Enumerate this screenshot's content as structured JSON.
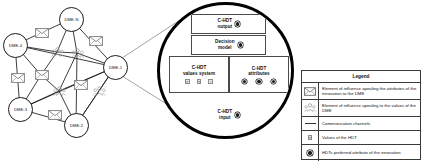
{
  "figure": {
    "network": {
      "nodes": [
        {
          "id": "dme-n",
          "label": "DME-N",
          "x": 59,
          "y": 7,
          "size": 25
        },
        {
          "id": "dme-4",
          "label": "DME-4",
          "x": 3,
          "y": 33,
          "size": 25
        },
        {
          "id": "dme-1",
          "label": "DME-1",
          "x": 103,
          "y": 55,
          "size": 25
        },
        {
          "id": "dme-3",
          "label": "DME-3",
          "x": 8,
          "y": 97,
          "size": 25
        },
        {
          "id": "dme-2",
          "label": "DME-2",
          "x": 64,
          "y": 113,
          "size": 25
        }
      ],
      "mail_icons": [
        {
          "id": "mail-1",
          "x": 35,
          "y": 28
        },
        {
          "id": "mail-2",
          "x": 89,
          "y": 36
        },
        {
          "id": "mail-3",
          "x": 11,
          "y": 73
        },
        {
          "id": "mail-4",
          "x": 35,
          "y": 70
        },
        {
          "id": "mail-5",
          "x": 74,
          "y": 80
        },
        {
          "id": "mail-6",
          "x": 48,
          "y": 110
        }
      ],
      "people_icons": [
        {
          "id": "people-1",
          "x": 51,
          "y": 47
        },
        {
          "id": "people-2",
          "x": 71,
          "y": 48
        },
        {
          "id": "people-3",
          "x": 53,
          "y": 86
        },
        {
          "id": "people-4",
          "x": 93,
          "y": 86
        }
      ]
    },
    "magnifier": {
      "output": {
        "label": "C-HDT\noutput",
        "marker": "hdt-preferred-attribute-dot"
      },
      "decision_model": {
        "label": "Decision\nmodel",
        "marker": "hdt-preferred-attribute-dot"
      },
      "values_system": {
        "label": "C-HDT\nvalues system",
        "markers": [
          "value-square",
          "value-square",
          "value-square"
        ]
      },
      "attributes": {
        "label": "C-HDT\nattributes",
        "markers": [
          "attribute-dot",
          "attribute-dot",
          "attribute-dot"
        ]
      },
      "input": {
        "label": "C-HDT\ninput",
        "marker": "hdt-preferred-attribute-dot"
      }
    },
    "legend": {
      "title": "Legend",
      "rows": [
        {
          "icon": "envelope-icon",
          "text": "Element of influence apealing the attributes of the innovation to the DME"
        },
        {
          "icon": "people-group-icon",
          "text": "Element of influence apealing to the values of the DME"
        },
        {
          "icon": "line-icon",
          "text": "Communication channels"
        },
        {
          "icon": "value-square-icon",
          "text": "Values of the HDT"
        },
        {
          "icon": "preferred-attribute-dot-icon",
          "text": "HDTs preferred attribute of the innovation"
        }
      ]
    },
    "colors": {
      "stroke": "#1a1a1a",
      "legend_border": "#3a3a3a",
      "icon_gray": "#8d8d8d"
    }
  }
}
